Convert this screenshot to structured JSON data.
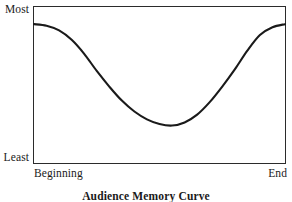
{
  "figure": {
    "caption": "Audience Memory Curve"
  },
  "axes": {
    "y_top_label": "Most",
    "y_bottom_label": "Least",
    "x_left_label": "Beginning",
    "x_right_label": "End"
  },
  "style": {
    "curve_color": "#1a1a1a",
    "frame_color": "#2b2b2b",
    "background": "#ffffff",
    "curve_width": 2.1
  },
  "chart_data": {
    "type": "line",
    "title": "Audience Memory Curve",
    "xlabel": "",
    "ylabel": "",
    "grid": false,
    "legend": "none",
    "xlim": [
      0,
      100
    ],
    "ylim": [
      0,
      100
    ],
    "x_tick_labels": [
      "Beginning",
      "End"
    ],
    "y_tick_labels": [
      "Least",
      "Most"
    ],
    "series": [
      {
        "name": "Audience memory",
        "x": [
          0,
          5,
          10,
          15,
          20,
          25,
          30,
          35,
          40,
          45,
          50,
          55,
          60,
          65,
          70,
          75,
          80,
          85,
          90,
          95,
          100
        ],
        "values": [
          89,
          88,
          85,
          79,
          70,
          59,
          49,
          40,
          33,
          28,
          25,
          24,
          26,
          31,
          39,
          49,
          60,
          72,
          82,
          87,
          89
        ]
      }
    ]
  }
}
